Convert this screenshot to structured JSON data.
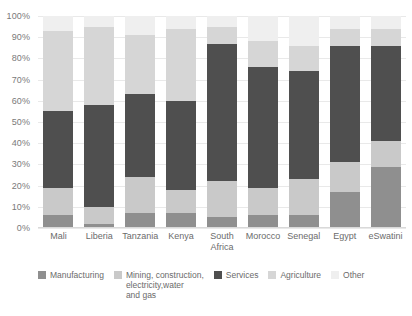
{
  "chart_data": {
    "type": "bar",
    "title": "",
    "subtitle": "",
    "xlabel": "",
    "ylabel": "",
    "stacked": true,
    "orientation": "vertical",
    "grid": true,
    "legend_position": "bottom",
    "ylim": [
      0,
      100
    ],
    "yticks": [
      "0%",
      "10%",
      "20%",
      "30%",
      "40%",
      "50%",
      "60%",
      "70%",
      "80%",
      "90%",
      "100%"
    ],
    "ytick_values": [
      0,
      10,
      20,
      30,
      40,
      50,
      60,
      70,
      80,
      90,
      100
    ],
    "categories": [
      "Mali",
      "Liberia",
      "Tanzania",
      "Kenya",
      "South\nAfrica",
      "Morocco",
      "Senegal",
      "Egypt",
      "eSwatini"
    ],
    "series": [
      {
        "name": "Other",
        "color": "#8f8f8f",
        "values": [
          6,
          2,
          7,
          7,
          5,
          6,
          6,
          17,
          29
        ]
      },
      {
        "name": "Agriculture",
        "color": "#c9c9c9",
        "values": [
          13,
          8,
          17,
          11,
          17,
          13,
          17,
          14,
          12
        ]
      },
      {
        "name": "Services",
        "color": "#4f4f4f",
        "values": [
          36,
          48,
          39,
          42,
          65,
          57,
          51,
          55,
          45
        ]
      },
      {
        "name": "Mining, construction,\nelectricity,water\nand gas",
        "color": "#d6d6d6",
        "values": [
          38,
          37,
          28,
          34,
          8,
          12,
          12,
          8,
          8
        ]
      },
      {
        "name": "Manufacturing",
        "color": "#efefef",
        "values": [
          7,
          5,
          9,
          6,
          5,
          12,
          14,
          6,
          6
        ]
      }
    ]
  },
  "legend": {
    "items": [
      {
        "label": "Manufacturing",
        "color": "#8f8f8f"
      },
      {
        "label": "Mining, construction,\nelectricity,water\nand gas",
        "color": "#c9c9c9"
      },
      {
        "label": "Services",
        "color": "#4f4f4f"
      },
      {
        "label": "Agriculture",
        "color": "#d6d6d6"
      },
      {
        "label": "Other",
        "color": "#efefef"
      }
    ]
  }
}
